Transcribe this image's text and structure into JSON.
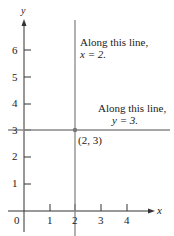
{
  "figure": {
    "axes": {
      "x_label": "x",
      "y_label": "y",
      "origin_label": "0",
      "x_ticks": [
        "1",
        "2",
        "3",
        "4"
      ],
      "y_ticks": [
        "1",
        "2",
        "3",
        "4",
        "5",
        "6"
      ]
    },
    "vertical_line": {
      "equation_value": 2,
      "annotation_line1": "Along this line,",
      "annotation_line2": "x = 2."
    },
    "horizontal_line": {
      "equation_value": 3,
      "annotation_line1": "Along this line,",
      "annotation_line2": "y = 3."
    },
    "intersection_point": {
      "label": "(2, 3)",
      "x": 2,
      "y": 3
    },
    "colors": {
      "axes": "#333333",
      "lines": "#888888",
      "point": "#777777",
      "text": "#222222"
    }
  }
}
